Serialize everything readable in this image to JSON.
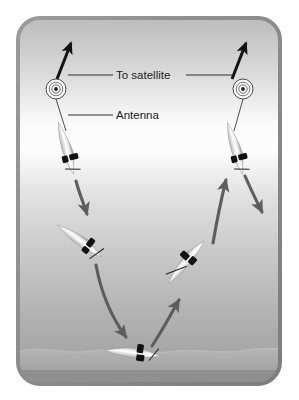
{
  "figure": {
    "name": "profiling-float-satellite-cycle",
    "frame": {
      "border_color": "#8c8c8c",
      "corner_radius": 22,
      "x": 18,
      "y": 18,
      "width": 262,
      "height": 366
    },
    "background": {
      "sky_top_color": "#b9b9b9",
      "surface_color": "#fdfdfd",
      "deep_color": "#9a9a9a",
      "seafloor_color": "#a9a9a9"
    }
  },
  "labels": [
    {
      "id": "to-satellite",
      "text": "To satellite",
      "x": 149,
      "y": 72
    },
    {
      "id": "antenna",
      "text": "Antenna",
      "x": 133,
      "y": 113
    }
  ],
  "leader_lines": [
    {
      "id": "to-satellite-left",
      "x1": 68,
      "y1": 75,
      "x2": 112,
      "y2": 75
    },
    {
      "id": "to-satellite-right",
      "x1": 186,
      "y1": 75,
      "x2": 231,
      "y2": 75
    },
    {
      "id": "antenna-left",
      "x1": 68,
      "y1": 115,
      "x2": 112,
      "y2": 115
    }
  ],
  "antennas": [
    {
      "id": "antenna-left",
      "cx": 56,
      "cy": 89,
      "rings": 3,
      "outer_r": 10
    },
    {
      "id": "antenna-right",
      "cx": 243,
      "cy": 89,
      "rings": 3,
      "outer_r": 10
    }
  ],
  "satellite_arrows": [
    {
      "id": "satellite-arrow-left",
      "x1": 57,
      "y1": 78,
      "x2": 70,
      "y2": 42
    },
    {
      "id": "satellite-arrow-right",
      "x1": 232,
      "y1": 78,
      "x2": 245,
      "y2": 42
    }
  ],
  "floats": [
    {
      "id": "float-surface-left",
      "cx": 67,
      "cy": 148,
      "angle": 166,
      "length": 52,
      "state": "at-surface-transmitting"
    },
    {
      "id": "float-surface-right",
      "cx": 236,
      "cy": 148,
      "angle": 166,
      "length": 52,
      "state": "at-surface-transmitting"
    },
    {
      "id": "float-descending",
      "cx": 80,
      "cy": 240,
      "angle": 128,
      "length": 52,
      "state": "descending"
    },
    {
      "id": "float-ascending",
      "cx": 185,
      "cy": 262,
      "angle": 42,
      "length": 52,
      "state": "ascending"
    },
    {
      "id": "float-drifting-depth",
      "cx": 132,
      "cy": 352,
      "angle": 98,
      "length": 52,
      "state": "drifting-at-depth"
    }
  ],
  "flow_arrows": [
    {
      "id": "arrow-descend-left-upper",
      "from": "float-surface-left",
      "to": "float-descending",
      "direction": "down"
    },
    {
      "id": "arrow-descend-left-lower",
      "from": "float-descending",
      "to": "float-drifting-depth",
      "direction": "down"
    },
    {
      "id": "arrow-ascend-center",
      "from": "float-drifting-depth",
      "to": "float-ascending",
      "direction": "up"
    },
    {
      "id": "arrow-ascend-right",
      "from": "float-ascending",
      "to": "float-surface-right",
      "direction": "up"
    },
    {
      "id": "arrow-descend-right",
      "from": "float-surface-right",
      "to": "next-cycle",
      "direction": "down"
    }
  ],
  "colors": {
    "arrow_gray": "#5d5d5d",
    "arrow_black": "#151515",
    "float_dark": "#101010",
    "float_body": "#f2f2f2",
    "line_gray": "#3a3a3a"
  }
}
